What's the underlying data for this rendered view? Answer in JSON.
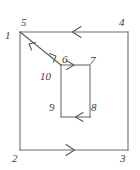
{
  "diagram": {
    "type": "contour-integration-path",
    "background_color": "#ffffff",
    "stroke_color": "#555555",
    "label_color": "#3c3c3c",
    "canvas": {
      "width": 140,
      "height": 170
    },
    "outer_square": {
      "name": "outer-square",
      "x": 20,
      "y": 32,
      "width": 108,
      "height": 118,
      "corners": [
        {
          "id": "1",
          "label": "1",
          "position": "top-left-outer"
        },
        {
          "id": "5",
          "label": "5",
          "position": "top-left-inner"
        },
        {
          "id": "4",
          "label": "4",
          "position": "top-right"
        },
        {
          "id": "3",
          "label": "3",
          "position": "bottom-right"
        },
        {
          "id": "2",
          "label": "2",
          "position": "bottom-left"
        }
      ],
      "edge_arrows": [
        {
          "edge": "top",
          "direction": "left"
        },
        {
          "edge": "bottom",
          "direction": "right"
        },
        {
          "edge": "left",
          "direction": "none"
        },
        {
          "edge": "right",
          "direction": "none"
        }
      ]
    },
    "inner_rectangle": {
      "name": "inner-rectangle",
      "x": 61,
      "y": 65,
      "width": 29,
      "height": 52,
      "corners": [
        {
          "id": "6",
          "label": "6",
          "position": "top-left"
        },
        {
          "id": "7",
          "label": "7",
          "position": "top-right"
        },
        {
          "id": "8",
          "label": "8",
          "position": "bottom-right"
        },
        {
          "id": "9",
          "label": "9",
          "position": "bottom-left"
        }
      ],
      "edge_arrows": [
        {
          "edge": "top",
          "direction": "right"
        },
        {
          "edge": "bottom",
          "direction": "left"
        },
        {
          "edge": "left",
          "direction": "none"
        },
        {
          "edge": "right",
          "direction": "none"
        }
      ]
    },
    "cut_line": {
      "name": "branch-cut",
      "label": "10",
      "from": {
        "id": "1",
        "x": 20,
        "y": 32
      },
      "to": {
        "id": "6",
        "x": 61,
        "y": 65
      },
      "arrows": [
        {
          "direction": "toward-1",
          "position": "near-start"
        },
        {
          "direction": "toward-6",
          "position": "near-end"
        }
      ]
    },
    "labels": [
      {
        "id": "label-1",
        "text": "1",
        "x": 5,
        "y": 30
      },
      {
        "id": "label-5",
        "text": "5",
        "x": 21,
        "y": 17
      },
      {
        "id": "label-4",
        "text": "4",
        "x": 119,
        "y": 17
      },
      {
        "id": "label-6",
        "text": "6",
        "x": 62,
        "y": 54
      },
      {
        "id": "label-7",
        "text": "7",
        "x": 90,
        "y": 55
      },
      {
        "id": "label-10",
        "text": "10",
        "x": 40,
        "y": 71
      },
      {
        "id": "label-9",
        "text": "9",
        "x": 49,
        "y": 102
      },
      {
        "id": "label-8",
        "text": "8",
        "x": 91,
        "y": 102
      },
      {
        "id": "label-2",
        "text": "2",
        "x": 12,
        "y": 153
      },
      {
        "id": "label-3",
        "text": "3",
        "x": 120,
        "y": 153
      }
    ]
  }
}
